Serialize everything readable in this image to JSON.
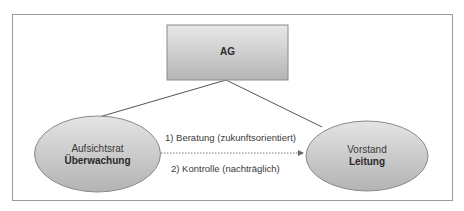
{
  "diagram": {
    "root": {
      "label": "AG"
    },
    "left_node": {
      "title": "Aufsichtsrat",
      "role": "Überwachung"
    },
    "right_node": {
      "title": "Vorstand",
      "role": "Leitung"
    },
    "relation": {
      "label_top": "1) Beratung (zukunftsorientiert)",
      "label_bottom": "2) Kontrolle (nachträglich)",
      "style": "dotted-arrow",
      "direction": "left-to-right"
    },
    "colors": {
      "frame_border": "#9a9a9a",
      "node_fill_light": "#e6e6e6",
      "node_fill_dark": "#b8b8b8",
      "node_border": "#8a8a8a",
      "line": "#555555"
    }
  }
}
